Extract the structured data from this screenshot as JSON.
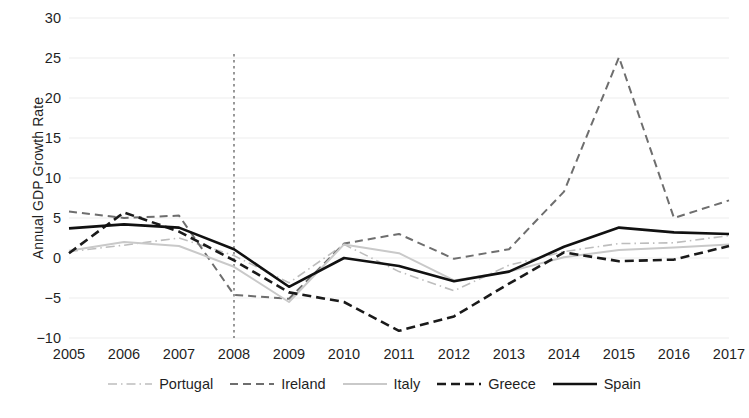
{
  "chart_data": {
    "type": "line",
    "title": "",
    "xlabel": "",
    "ylabel": "Annual GDP Growth Rate",
    "x": [
      2005,
      2006,
      2007,
      2008,
      2009,
      2010,
      2011,
      2012,
      2013,
      2014,
      2015,
      2016,
      2017
    ],
    "xtick_labels": [
      "2005",
      "2006",
      "2007",
      "2008",
      "2009",
      "2010",
      "2011",
      "2012",
      "2013",
      "2014",
      "2015",
      "2016",
      "2017"
    ],
    "ytick_labels": [
      "30",
      "25",
      "20",
      "15",
      "10",
      "5",
      "0",
      "−5",
      "−10"
    ],
    "ytick_values": [
      30,
      25,
      20,
      15,
      10,
      5,
      0,
      -5,
      -10
    ],
    "xlim": [
      2005,
      2017
    ],
    "ylim": [
      -10,
      30
    ],
    "grid": "horizontal-faint",
    "legend_position": "bottom",
    "annotations": [
      {
        "name": "crisis-marker",
        "type": "vline",
        "x": 2008,
        "style": "dotted",
        "color": "#555555"
      }
    ],
    "series": [
      {
        "name": "Portugal",
        "color": "#bdbdbd",
        "style": "dash-dot",
        "width": 1.6,
        "values": [
          0.8,
          1.6,
          2.5,
          0.3,
          -3.1,
          1.7,
          -1.7,
          -4.1,
          -0.9,
          0.8,
          1.8,
          1.9,
          2.8
        ]
      },
      {
        "name": "Ireland",
        "color": "#6e6e6e",
        "style": "dashed",
        "width": 2.0,
        "values": [
          5.8,
          5.0,
          5.3,
          -4.6,
          -5.1,
          1.8,
          3.0,
          -0.1,
          1.1,
          8.3,
          25.1,
          5.0,
          7.2
        ]
      },
      {
        "name": "Italy",
        "color": "#c9c9c9",
        "style": "solid",
        "width": 2.0,
        "values": [
          0.9,
          2.0,
          1.5,
          -1.1,
          -5.5,
          1.7,
          0.6,
          -2.8,
          -1.7,
          0.1,
          1.0,
          1.3,
          1.7
        ]
      },
      {
        "name": "Greece",
        "color": "#1a1a1a",
        "style": "dashed",
        "width": 2.6,
        "values": [
          0.6,
          5.7,
          3.3,
          -0.3,
          -4.3,
          -5.5,
          -9.1,
          -7.3,
          -3.2,
          0.7,
          -0.4,
          -0.2,
          1.5
        ]
      },
      {
        "name": "Spain",
        "color": "#111111",
        "style": "solid",
        "width": 2.6,
        "values": [
          3.7,
          4.2,
          3.8,
          1.1,
          -3.6,
          0.0,
          -1.0,
          -2.9,
          -1.7,
          1.4,
          3.8,
          3.2,
          3.0
        ]
      }
    ]
  }
}
